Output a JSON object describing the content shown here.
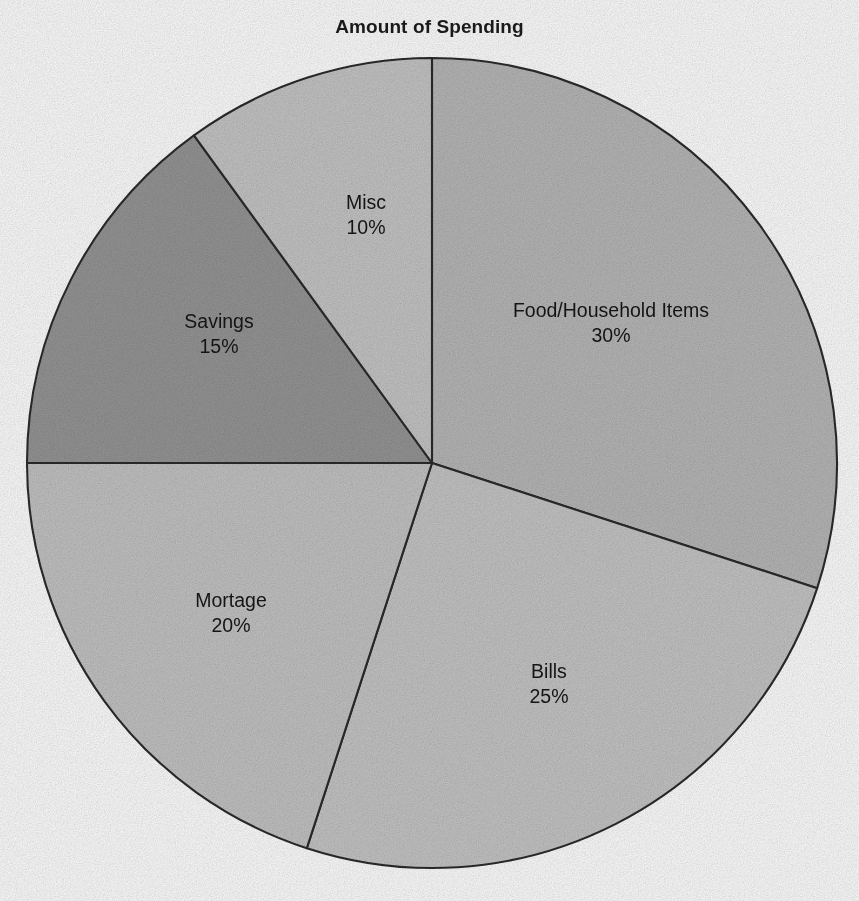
{
  "chart_data": {
    "type": "pie",
    "title": "Amount of Spending",
    "xlabel": "",
    "ylabel": "",
    "legend_position": "none",
    "grid": false,
    "labels_inside_slices": true,
    "start_angle_deg": 0,
    "direction": "clockwise",
    "categories": [
      "Food/Household Items",
      "Bills",
      "Mortage",
      "Savings",
      "Misc"
    ],
    "values": [
      30,
      25,
      20,
      15,
      10
    ],
    "value_unit": "%",
    "slices": [
      {
        "name": "Food/Household Items",
        "value": 30,
        "value_text": "30%",
        "color": "#b8b8b8",
        "start_deg": 0,
        "end_deg": 108,
        "label_x": 611,
        "label_y": 323
      },
      {
        "name": "Bills",
        "value": 25,
        "value_text": "25%",
        "color": "#c6c6c6",
        "start_deg": 108,
        "end_deg": 198,
        "label_x": 549,
        "label_y": 684
      },
      {
        "name": "Mortage",
        "value": 20,
        "value_text": "20%",
        "color": "#c4c4c4",
        "start_deg": 198,
        "end_deg": 270,
        "label_x": 231,
        "label_y": 613
      },
      {
        "name": "Savings",
        "value": 15,
        "value_text": "15%",
        "color": "#969696",
        "start_deg": 270,
        "end_deg": 324,
        "label_x": 219,
        "label_y": 334
      },
      {
        "name": "Misc",
        "value": 10,
        "value_text": "10%",
        "color": "#c6c6c6",
        "start_deg": 324,
        "end_deg": 360,
        "label_x": 366,
        "label_y": 215
      }
    ],
    "geometry": {
      "center_x": 432,
      "center_y": 463,
      "radius": 405,
      "outline_color": "#2b2b2b",
      "outline_width": 2.1
    }
  }
}
